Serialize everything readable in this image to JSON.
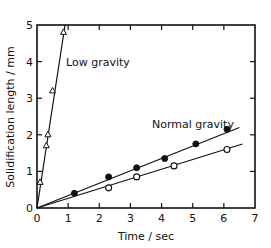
{
  "chart_data": {
    "type": "scatter",
    "title": "",
    "xlabel": "Time / sec",
    "ylabel": "Solidification length / mm",
    "xlim": [
      0,
      7
    ],
    "ylim": [
      0,
      5
    ],
    "xticks": [
      "0",
      "1",
      "2",
      "3",
      "4",
      "5",
      "6",
      "7"
    ],
    "yticks": [
      "0",
      "1",
      "2",
      "3",
      "4",
      "5"
    ],
    "grid": false,
    "legend": null,
    "annotations": [
      {
        "text": "Low gravity",
        "x": 1.2,
        "y": 4.0
      },
      {
        "text": "Normal gravity",
        "x": 3.7,
        "y": 2.3
      }
    ],
    "series": [
      {
        "name": "Low gravity",
        "marker": "open-triangle",
        "points": [
          [
            0.1,
            0.7
          ],
          [
            0.3,
            1.7
          ],
          [
            0.35,
            2.0
          ],
          [
            0.5,
            3.2
          ],
          [
            0.85,
            4.8
          ]
        ],
        "fit_line": [
          [
            0,
            0
          ],
          [
            0.9,
            5.0
          ]
        ]
      },
      {
        "name": "Normal gravity (filled)",
        "marker": "filled-circle",
        "points": [
          [
            1.2,
            0.4
          ],
          [
            2.3,
            0.85
          ],
          [
            3.2,
            1.1
          ],
          [
            4.1,
            1.35
          ],
          [
            5.1,
            1.75
          ],
          [
            6.1,
            2.15
          ]
        ],
        "fit_line": [
          [
            0,
            0
          ],
          [
            6.5,
            2.2
          ]
        ]
      },
      {
        "name": "Normal gravity (open)",
        "marker": "open-circle",
        "points": [
          [
            2.3,
            0.55
          ],
          [
            3.2,
            0.85
          ],
          [
            4.4,
            1.15
          ],
          [
            6.1,
            1.6
          ]
        ],
        "fit_line": [
          [
            0,
            0
          ],
          [
            6.6,
            1.75
          ]
        ]
      }
    ]
  }
}
